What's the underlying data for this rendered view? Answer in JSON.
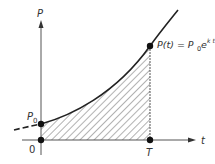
{
  "diagram": {
    "y_axis_label": "P",
    "x_axis_label": "t",
    "origin_label": "0",
    "p0_label": "P",
    "p0_subscript": "0",
    "t_point_label": "T",
    "curve_label": {
      "lhs": "P(t) = P",
      "sub": "0",
      "base": "e",
      "exponent": "k t"
    },
    "shaded_region": "area under curve from t=0 to t=T (hatched)",
    "colors": {
      "line": "#222222",
      "axis": "#555555",
      "hatch": "#666666"
    }
  }
}
